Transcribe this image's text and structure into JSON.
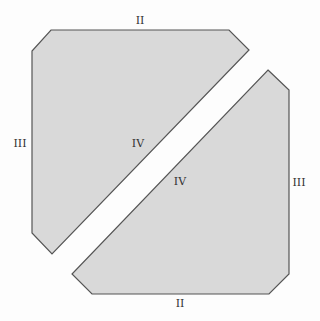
{
  "diagram": {
    "fill_color": "#d9d9d9",
    "stroke_color": "#555555",
    "pieces": [
      {
        "name": "upper-left-piece",
        "points": "51,30 229,30 249,50 52,254 32,233 32,51"
      },
      {
        "name": "lower-right-piece",
        "points": "268,70 289,90 289,274 269,294 92,294 72,274"
      }
    ],
    "labels": [
      {
        "name": "label-top-edge",
        "text": "II",
        "x": 140,
        "y": 20
      },
      {
        "name": "label-left-edge",
        "text": "III",
        "x": 20,
        "y": 143
      },
      {
        "name": "label-upper-diagonal",
        "text": "IV",
        "x": 138,
        "y": 143
      },
      {
        "name": "label-lower-diagonal",
        "text": "IV",
        "x": 180,
        "y": 181
      },
      {
        "name": "label-right-edge",
        "text": "III",
        "x": 299,
        "y": 182
      },
      {
        "name": "label-bottom-edge",
        "text": "II",
        "x": 180,
        "y": 303
      }
    ]
  }
}
